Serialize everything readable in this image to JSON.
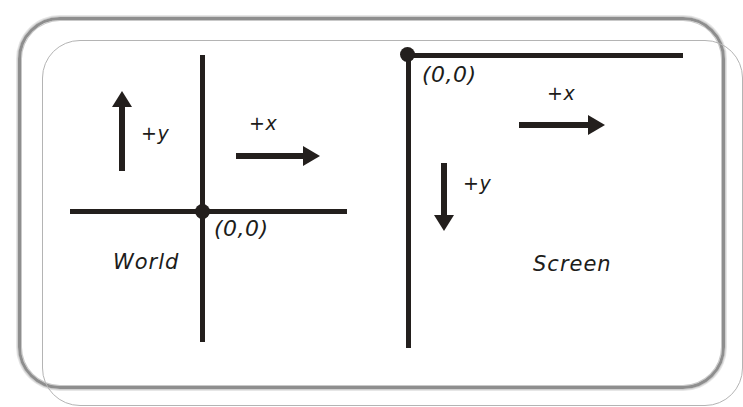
{
  "figure": {
    "background_color": "#ffffff",
    "ink_color": "#231f1d",
    "frame_color": "#8e8e8e"
  },
  "frame": {
    "shape": "rounded-rectangle",
    "corner_radius_px": 42
  },
  "systems": [
    {
      "id": "world",
      "name_label": "World",
      "origin_label": "(0,0)",
      "axes": {
        "vertical": {
          "orientation": "vertical",
          "extends": "both"
        },
        "horizontal": {
          "orientation": "horizontal",
          "extends": "both"
        }
      },
      "directions": [
        {
          "id": "world-plus-y",
          "label": "+y",
          "points": "up"
        },
        {
          "id": "world-plus-x",
          "label": "+x",
          "points": "right"
        }
      ]
    },
    {
      "id": "screen",
      "name_label": "Screen",
      "origin_label": "(0,0)",
      "axes": {
        "vertical": {
          "orientation": "vertical",
          "extends": "down"
        },
        "horizontal": {
          "orientation": "horizontal",
          "extends": "right"
        }
      },
      "directions": [
        {
          "id": "screen-plus-x",
          "label": "+x",
          "points": "right"
        },
        {
          "id": "screen-plus-y",
          "label": "+y",
          "points": "down"
        }
      ]
    }
  ]
}
